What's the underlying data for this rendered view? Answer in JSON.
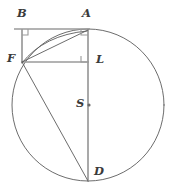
{
  "figure": {
    "width": 173,
    "height": 194,
    "background_color": "#ffffff",
    "stroke_color": "#5b5b5b",
    "construction_color": "#9a9a9a",
    "label_color": "#3a3a3a"
  },
  "circle": {
    "center_label": "S",
    "center_x": 88,
    "center_y": 105,
    "radius": 76
  },
  "points": [
    {
      "id": "B",
      "label": "B",
      "x": 22,
      "y": 29,
      "label_x": 17,
      "label_y": 8,
      "on_circle": false
    },
    {
      "id": "A",
      "label": "A",
      "x": 88,
      "y": 29,
      "label_x": 82,
      "label_y": 8,
      "on_circle": true
    },
    {
      "id": "F",
      "label": "F",
      "x": 22,
      "y": 62,
      "label_x": 7,
      "label_y": 53,
      "on_circle": true
    },
    {
      "id": "L",
      "label": "L",
      "x": 88,
      "y": 62,
      "label_x": 96,
      "label_y": 54,
      "on_circle": false
    },
    {
      "id": "S",
      "label": "S",
      "x": 88,
      "y": 105,
      "label_x": 76,
      "label_y": 98,
      "on_circle": false
    },
    {
      "id": "D",
      "label": "D",
      "x": 88,
      "y": 181,
      "label_x": 94,
      "label_y": 166,
      "on_circle": true
    }
  ],
  "segments": [
    {
      "id": "BA",
      "from": "B",
      "to": "A",
      "style": "construction"
    },
    {
      "id": "BF",
      "from": "B",
      "to": "F",
      "style": "construction"
    },
    {
      "id": "FL",
      "from": "F",
      "to": "L",
      "style": "construction"
    },
    {
      "id": "AD",
      "from": "A",
      "to": "D",
      "style": "construction"
    },
    {
      "id": "FA",
      "from": "F",
      "to": "A",
      "style": "chord"
    },
    {
      "id": "FD",
      "from": "F",
      "to": "D",
      "style": "chord"
    }
  ],
  "arcs": [
    {
      "id": "arc-FA",
      "from": "F",
      "to": "A",
      "style": "chord"
    }
  ],
  "right_angles": [
    {
      "id": "angle-at-B",
      "vertex": "B"
    },
    {
      "id": "angle-at-A",
      "vertex": "A"
    },
    {
      "id": "angle-at-L",
      "vertex": "L"
    }
  ]
}
